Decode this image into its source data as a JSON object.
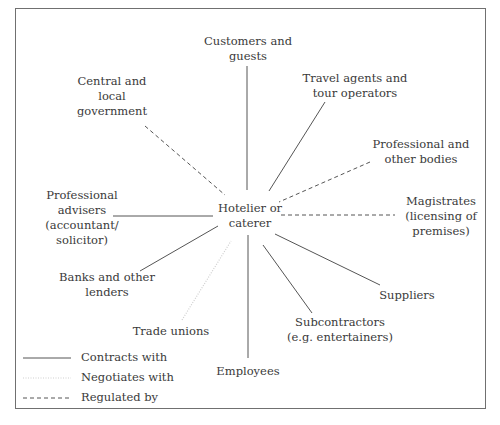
{
  "center": {
    "line1": "Hotelier or",
    "line2": "caterer"
  },
  "nodes": {
    "customers": {
      "line1": "Customers and",
      "line2": "guests",
      "relation": "contracts"
    },
    "central_gov": {
      "line1": "Central and",
      "line2": "local",
      "line3": "government",
      "relation": "regulated"
    },
    "travel": {
      "line1": "Travel agents and",
      "line2": "tour operators",
      "relation": "contracts"
    },
    "prof_bodies": {
      "line1": "Professional and",
      "line2": "other bodies",
      "relation": "regulated"
    },
    "magistrates": {
      "line1": "Magistrates",
      "line2": "(licensing of",
      "line3": "premises)",
      "relation": "regulated"
    },
    "prof_advisers": {
      "line1": "Professional",
      "line2": "advisers",
      "line3": "(accountant/",
      "line4": "solicitor)",
      "relation": "contracts"
    },
    "banks": {
      "line1": "Banks and other",
      "line2": "lenders",
      "relation": "contracts"
    },
    "trade_unions": {
      "line1": "Trade unions",
      "relation": "negotiates"
    },
    "employees": {
      "line1": "Employees",
      "relation": "contracts"
    },
    "subcontractors": {
      "line1": "Subcontractors",
      "line2": "(e.g. entertainers)",
      "relation": "contracts"
    },
    "suppliers": {
      "line1": "Suppliers",
      "relation": "contracts"
    }
  },
  "legend": {
    "contracts": "Contracts with",
    "negotiates": "Negotiates with",
    "regulated": "Regulated by"
  },
  "colors": {
    "line": "#555555",
    "dotted": "#d0d0d0",
    "text": "#3a3a3a"
  }
}
